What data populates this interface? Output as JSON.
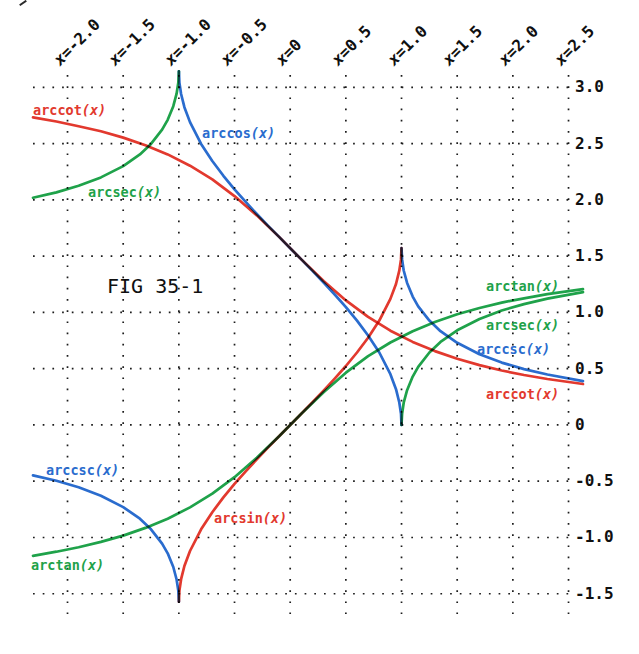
{
  "figure": {
    "title": "FIG 35-1"
  },
  "colors": {
    "red": "#e2392e",
    "green": "#1fa24a",
    "blue": "#2a6cce",
    "grid": "#1c1c1c",
    "text": "#101010",
    "background": "#ffffff"
  },
  "chart_data": {
    "type": "line",
    "title": "FIG 35-1",
    "xlabel": "x",
    "ylabel": "",
    "xlim": [
      -2.31,
      2.63
    ],
    "ylim": [
      -1.68,
      3.11
    ],
    "grid": "dotted",
    "legend_position": "inline-labels",
    "x_ticks": [
      {
        "prefix": "x",
        "rest": "=-2.0",
        "value": -2.0
      },
      {
        "prefix": "x",
        "rest": "=-1.5",
        "value": -1.5
      },
      {
        "prefix": "x",
        "rest": "=-1.0",
        "value": -1.0
      },
      {
        "prefix": "x",
        "rest": "=-0.5",
        "value": -0.5
      },
      {
        "prefix": "x",
        "rest": "=0",
        "value": 0.0
      },
      {
        "prefix": "x",
        "rest": "=0.5",
        "value": 0.5
      },
      {
        "prefix": "x",
        "rest": "=1.0",
        "value": 1.0
      },
      {
        "prefix": "x",
        "rest": "=1.5",
        "value": 1.5
      },
      {
        "prefix": "x",
        "rest": "=2.0",
        "value": 2.0
      },
      {
        "prefix": "x",
        "rest": "=2.5",
        "value": 2.5
      }
    ],
    "y_ticks": [
      {
        "label": "3.0",
        "value": 3.0
      },
      {
        "label": "2.5",
        "value": 2.5
      },
      {
        "label": "2.0",
        "value": 2.0
      },
      {
        "label": "1.5",
        "value": 1.5
      },
      {
        "label": "1.0",
        "value": 1.0
      },
      {
        "label": "0.5",
        "value": 0.5
      },
      {
        "label": "0",
        "value": 0.0
      },
      {
        "label": "-0.5",
        "value": -0.5
      },
      {
        "label": "-1.0",
        "value": -1.0
      },
      {
        "label": "-1.5",
        "value": -1.5
      }
    ],
    "series": [
      {
        "id": "arctan",
        "color": "green",
        "points": [
          [
            -2.31,
            -1.163
          ],
          [
            -2.1,
            -1.126
          ],
          [
            -1.9,
            -1.087
          ],
          [
            -1.7,
            -1.039
          ],
          [
            -1.5,
            -0.983
          ],
          [
            -1.3,
            -0.915
          ],
          [
            -1.1,
            -0.833
          ],
          [
            -0.9,
            -0.733
          ],
          [
            -0.7,
            -0.611
          ],
          [
            -0.5,
            -0.464
          ],
          [
            -0.3,
            -0.291
          ],
          [
            -0.1,
            -0.1
          ],
          [
            0.1,
            0.1
          ],
          [
            0.3,
            0.291
          ],
          [
            0.5,
            0.464
          ],
          [
            0.7,
            0.611
          ],
          [
            0.9,
            0.733
          ],
          [
            1.1,
            0.833
          ],
          [
            1.3,
            0.915
          ],
          [
            1.5,
            0.983
          ],
          [
            1.7,
            1.039
          ],
          [
            1.9,
            1.087
          ],
          [
            2.1,
            1.126
          ],
          [
            2.31,
            1.163
          ],
          [
            2.63,
            1.207
          ]
        ]
      },
      {
        "id": "arcsec-left",
        "color": "green",
        "points": [
          [
            -2.31,
            2.019
          ],
          [
            -2.1,
            2.067
          ],
          [
            -1.9,
            2.125
          ],
          [
            -1.7,
            2.2
          ],
          [
            -1.5,
            2.3
          ],
          [
            -1.35,
            2.404
          ],
          [
            -1.25,
            2.498
          ],
          [
            -1.15,
            2.624
          ],
          [
            -1.1,
            2.712
          ],
          [
            -1.05,
            2.833
          ],
          [
            -1.02,
            2.944
          ],
          [
            -1.005,
            3.042
          ],
          [
            -1,
            3.142
          ]
        ]
      },
      {
        "id": "arcsec-right",
        "color": "green",
        "points": [
          [
            1,
            0
          ],
          [
            1.005,
            0.1
          ],
          [
            1.02,
            0.198
          ],
          [
            1.05,
            0.309
          ],
          [
            1.1,
            0.43
          ],
          [
            1.15,
            0.517
          ],
          [
            1.25,
            0.644
          ],
          [
            1.35,
            0.738
          ],
          [
            1.5,
            0.841
          ],
          [
            1.7,
            0.942
          ],
          [
            1.9,
            1.017
          ],
          [
            2.1,
            1.074
          ],
          [
            2.31,
            1.123
          ],
          [
            2.63,
            1.181
          ]
        ]
      },
      {
        "id": "arccos",
        "color": "blue",
        "points": [
          [
            -1,
            3.142
          ],
          [
            -0.995,
            3.042
          ],
          [
            -0.98,
            2.941
          ],
          [
            -0.95,
            2.824
          ],
          [
            -0.9,
            2.691
          ],
          [
            -0.8,
            2.498
          ],
          [
            -0.7,
            2.346
          ],
          [
            -0.6,
            2.214
          ],
          [
            -0.5,
            2.094
          ],
          [
            -0.4,
            1.982
          ],
          [
            -0.3,
            1.875
          ],
          [
            -0.2,
            1.772
          ],
          [
            -0.1,
            1.671
          ],
          [
            0,
            1.571
          ],
          [
            0.1,
            1.471
          ],
          [
            0.2,
            1.369
          ],
          [
            0.3,
            1.266
          ],
          [
            0.4,
            1.159
          ],
          [
            0.5,
            1.047
          ],
          [
            0.6,
            0.927
          ],
          [
            0.7,
            0.795
          ],
          [
            0.8,
            0.644
          ],
          [
            0.9,
            0.451
          ],
          [
            0.95,
            0.318
          ],
          [
            0.98,
            0.2
          ],
          [
            0.995,
            0.1
          ],
          [
            1,
            0
          ]
        ]
      },
      {
        "id": "arccsc-left",
        "color": "blue",
        "points": [
          [
            -2.31,
            -0.448
          ],
          [
            -2.1,
            -0.496
          ],
          [
            -1.9,
            -0.554
          ],
          [
            -1.7,
            -0.629
          ],
          [
            -1.5,
            -0.73
          ],
          [
            -1.35,
            -0.833
          ],
          [
            -1.25,
            -0.927
          ],
          [
            -1.15,
            -1.054
          ],
          [
            -1.1,
            -1.141
          ],
          [
            -1.05,
            -1.262
          ],
          [
            -1.02,
            -1.373
          ],
          [
            -1.005,
            -1.471
          ],
          [
            -1,
            -1.571
          ]
        ]
      },
      {
        "id": "arccsc-right",
        "color": "blue",
        "points": [
          [
            1,
            1.571
          ],
          [
            1.005,
            1.471
          ],
          [
            1.02,
            1.373
          ],
          [
            1.05,
            1.262
          ],
          [
            1.1,
            1.141
          ],
          [
            1.15,
            1.054
          ],
          [
            1.25,
            0.927
          ],
          [
            1.35,
            0.833
          ],
          [
            1.5,
            0.73
          ],
          [
            1.7,
            0.629
          ],
          [
            1.9,
            0.554
          ],
          [
            2.1,
            0.496
          ],
          [
            2.31,
            0.448
          ],
          [
            2.63,
            0.39
          ]
        ]
      },
      {
        "id": "arccot",
        "color": "red",
        "points": [
          [
            -2.31,
            2.733
          ],
          [
            -2.1,
            2.697
          ],
          [
            -1.9,
            2.655
          ],
          [
            -1.7,
            2.61
          ],
          [
            -1.5,
            2.554
          ],
          [
            -1.3,
            2.486
          ],
          [
            -1.1,
            2.404
          ],
          [
            -0.9,
            2.304
          ],
          [
            -0.7,
            2.182
          ],
          [
            -0.5,
            2.034
          ],
          [
            -0.3,
            1.862
          ],
          [
            -0.1,
            1.671
          ],
          [
            0.1,
            1.471
          ],
          [
            0.3,
            1.279
          ],
          [
            0.5,
            1.107
          ],
          [
            0.7,
            0.96
          ],
          [
            0.9,
            0.838
          ],
          [
            1.1,
            0.738
          ],
          [
            1.3,
            0.656
          ],
          [
            1.5,
            0.588
          ],
          [
            1.7,
            0.532
          ],
          [
            1.9,
            0.484
          ],
          [
            2.1,
            0.444
          ],
          [
            2.31,
            0.408
          ],
          [
            2.63,
            0.364
          ]
        ]
      },
      {
        "id": "arcsin",
        "color": "red",
        "points": [
          [
            -1,
            -1.571
          ],
          [
            -0.995,
            -1.471
          ],
          [
            -0.98,
            -1.371
          ],
          [
            -0.95,
            -1.253
          ],
          [
            -0.9,
            -1.12
          ],
          [
            -0.8,
            -0.927
          ],
          [
            -0.7,
            -0.775
          ],
          [
            -0.6,
            -0.644
          ],
          [
            -0.5,
            -0.524
          ],
          [
            -0.4,
            -0.412
          ],
          [
            -0.3,
            -0.305
          ],
          [
            -0.2,
            -0.201
          ],
          [
            -0.1,
            -0.1
          ],
          [
            0,
            0
          ],
          [
            0.1,
            0.1
          ],
          [
            0.2,
            0.201
          ],
          [
            0.3,
            0.305
          ],
          [
            0.4,
            0.412
          ],
          [
            0.5,
            0.524
          ],
          [
            0.6,
            0.644
          ],
          [
            0.7,
            0.775
          ],
          [
            0.8,
            0.927
          ],
          [
            0.9,
            1.12
          ],
          [
            0.95,
            1.253
          ],
          [
            0.98,
            1.371
          ],
          [
            0.995,
            1.471
          ],
          [
            1,
            1.571
          ]
        ]
      }
    ],
    "curve_labels": [
      {
        "id": "arccot-left-label",
        "name": "arccot",
        "arg": "(x)",
        "color": "red",
        "pos": [
          33,
          103
        ]
      },
      {
        "id": "arccos-label",
        "name": "arccos",
        "arg": "(x)",
        "color": "blue",
        "pos": [
          202,
          126
        ]
      },
      {
        "id": "arcsec-left-label",
        "name": "arcsec",
        "arg": "(x)",
        "color": "green",
        "pos": [
          88,
          185
        ]
      },
      {
        "id": "arctan-right-label",
        "name": "arctan",
        "arg": "(x)",
        "color": "green",
        "pos": [
          486,
          279
        ]
      },
      {
        "id": "arcsec-right-label",
        "name": "arcsec",
        "arg": "(x)",
        "color": "green",
        "pos": [
          486,
          318
        ]
      },
      {
        "id": "arccsc-right-label",
        "name": "arccsc",
        "arg": "(x)",
        "color": "blue",
        "pos": [
          477,
          342
        ]
      },
      {
        "id": "arccot-right-label",
        "name": "arccot",
        "arg": "(x)",
        "color": "red",
        "pos": [
          486,
          387
        ]
      },
      {
        "id": "arccsc-left-label",
        "name": "arccsc",
        "arg": "(x)",
        "color": "blue",
        "pos": [
          46,
          463
        ]
      },
      {
        "id": "arcsin-label",
        "name": "arcsin",
        "arg": "(x)",
        "color": "red",
        "pos": [
          214,
          511
        ]
      },
      {
        "id": "arctan-left-label",
        "name": "arctan",
        "arg": "(x)",
        "color": "green",
        "pos": [
          31,
          558
        ]
      }
    ]
  }
}
